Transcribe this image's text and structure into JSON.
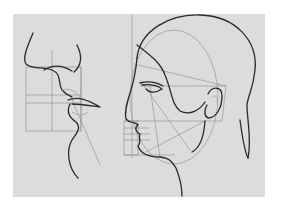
{
  "image": {
    "subject": "Proportional construction drawing of a human head in profile",
    "panels": [
      {
        "name": "nose-and-lips-profile-study",
        "description": "Close-up profile of nose, lips and chin with proportion grid"
      },
      {
        "name": "head-profile-study",
        "description": "Full head profile facing left with ear, construction lines, oval guide and proportion grid"
      }
    ],
    "colors": {
      "background": "#ffffff",
      "paper": "#dcdcdc",
      "ink": "#2a2a2a",
      "guides": "#8c8c8c"
    }
  }
}
